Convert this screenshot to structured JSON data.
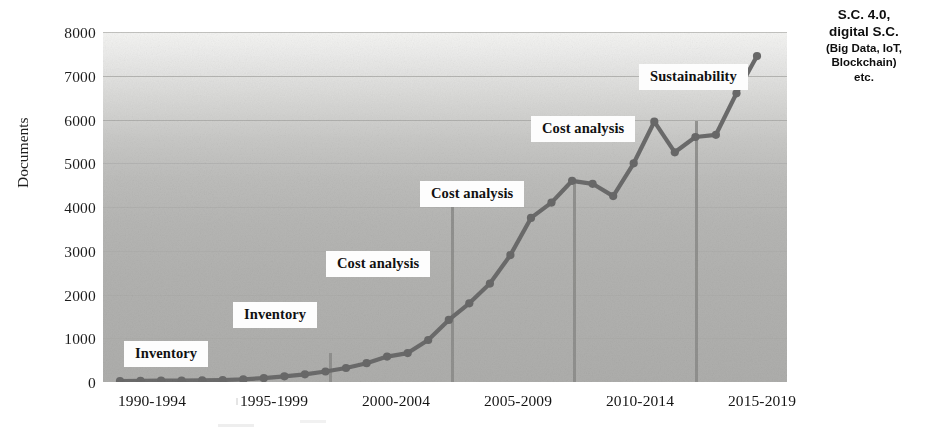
{
  "chart_data": {
    "type": "line",
    "title": "",
    "xlabel": "",
    "ylabel": "Documents",
    "ylim": [
      0,
      8000
    ],
    "ytick_values": [
      8000,
      7000,
      6000,
      5000,
      4000,
      3000,
      2000,
      1000,
      0
    ],
    "ytick_labels": [
      "8000",
      "7000",
      "6000",
      "5000",
      "4000",
      "3000",
      "2000",
      "1000",
      "0"
    ],
    "xtick_labels": [
      "1990-1994",
      "1995-1999",
      "2000-2004",
      "2005-2009",
      "2010-2014",
      "2015-2019"
    ],
    "grid": true,
    "legend": "none",
    "x": [
      1990,
      1991,
      1992,
      1993,
      1994,
      1995,
      1996,
      1997,
      1998,
      1999,
      2000,
      2001,
      2002,
      2003,
      2004,
      2005,
      2006,
      2007,
      2008,
      2009,
      2010,
      2011,
      2012,
      2013,
      2014,
      2015,
      2016,
      2017,
      2018,
      2019,
      2020,
      2021
    ],
    "values": [
      20,
      25,
      30,
      35,
      40,
      45,
      60,
      90,
      130,
      175,
      240,
      320,
      430,
      580,
      660,
      960,
      1420,
      1800,
      2250,
      2900,
      3750,
      4100,
      4600,
      4530,
      4250,
      5000,
      5950,
      5250,
      5600,
      5650,
      6600,
      7450
    ],
    "annotations": [
      {
        "label": "Inventory",
        "period": "1990-1994"
      },
      {
        "label": "Inventory",
        "period": "1995-1999"
      },
      {
        "label": "Cost analysis",
        "period": "2000-2004"
      },
      {
        "label": "Cost analysis",
        "period": "2005-2009"
      },
      {
        "label": "Cost analysis",
        "period": "2010-2014"
      },
      {
        "label": "Sustainability",
        "period": "2015-2019"
      }
    ],
    "side_note": {
      "line1": "S.C. 4.0,",
      "line2": "digital S.C.",
      "line3": "(Big Data, IoT,",
      "line4": "Blockchain)",
      "line5": "etc."
    },
    "colors": {
      "line": "#6b6b6b",
      "marker": "#696969",
      "grid": "#a5a5a3",
      "dropline": "#8d8d8b",
      "callout_bg": "#fdfdfd",
      "text": "#111111",
      "plot_bg_top": "#f4f4f2",
      "plot_bg_bottom": "#aeaeac"
    }
  }
}
